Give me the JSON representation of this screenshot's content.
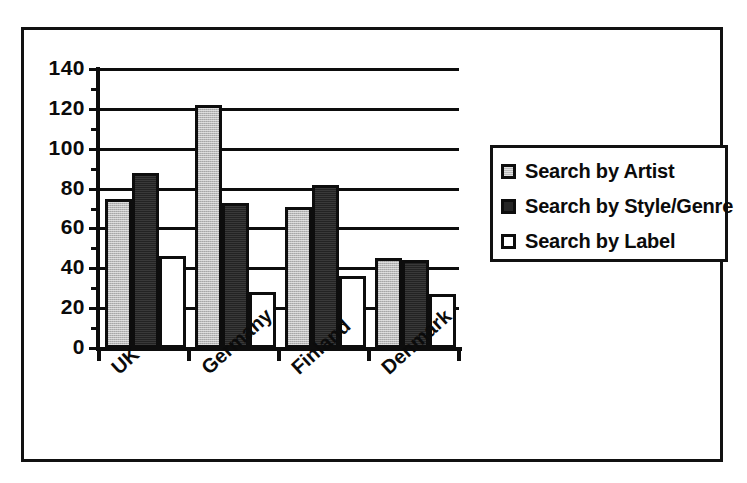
{
  "chart_data": {
    "type": "bar",
    "title": "",
    "xlabel": "",
    "ylabel": "",
    "categories": [
      "UK",
      "Germany",
      "Finland",
      "Denmark"
    ],
    "series": [
      {
        "name": "Search by Artist",
        "values": [
          75,
          122,
          71,
          45
        ],
        "color": "#b9b9b9"
      },
      {
        "name": "Search by Style/Genre",
        "values": [
          88,
          73,
          82,
          44
        ],
        "color": "#232323"
      },
      {
        "name": "Search by Label",
        "values": [
          46,
          28,
          36,
          27
        ],
        "color": "#ffffff"
      }
    ],
    "ylim": [
      0,
      140
    ],
    "y_ticks": [
      0,
      20,
      40,
      60,
      80,
      100,
      120,
      140
    ],
    "y_tick_labels": [
      "0",
      "20",
      "40",
      "60",
      "80",
      "100",
      "120",
      "140"
    ],
    "grid": true,
    "grid_axis": "y",
    "legend_position": "right"
  },
  "legend": {
    "items": [
      {
        "label": "Search by Artist"
      },
      {
        "label": "Search by Style/Genre"
      },
      {
        "label": "Search by Label"
      }
    ]
  }
}
